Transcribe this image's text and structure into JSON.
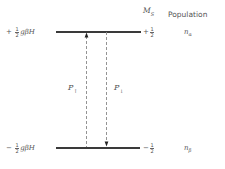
{
  "headers": {
    "ms_main": "M",
    "ms_sub": "S",
    "population": "Population"
  },
  "levels": [
    {
      "name": "upper",
      "sign": "+",
      "frac_num": "1",
      "frac_den": "2",
      "energy_rest": "gβH",
      "ms_sign": "+",
      "ms_num": "1",
      "ms_den": "2",
      "pop_main": "n",
      "pop_sub": "α"
    },
    {
      "name": "lower",
      "sign": "−",
      "frac_num": "1",
      "frac_den": "2",
      "energy_rest": "gβH",
      "ms_sign": "−",
      "ms_num": "1",
      "ms_den": "2",
      "pop_main": "n",
      "pop_sub": "β"
    }
  ],
  "transitions": [
    {
      "name": "absorption",
      "label_main": "P",
      "label_sub": "↑",
      "direction": "up"
    },
    {
      "name": "emission",
      "label_main": "P",
      "label_sub": "↓",
      "direction": "down"
    }
  ],
  "colors": {
    "level_line": "#3a3a3a",
    "dashed_line": "#888888",
    "text": "#555555"
  }
}
